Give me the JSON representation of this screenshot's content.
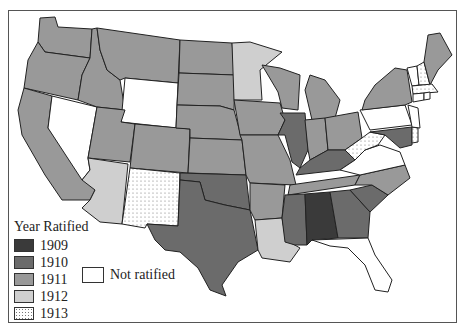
{
  "legend": {
    "title": "Year Ratified",
    "items": [
      {
        "label": "1909",
        "color": "#3a3a3a",
        "pattern": "solid"
      },
      {
        "label": "1910",
        "color": "#6b6b6b",
        "pattern": "solid"
      },
      {
        "label": "1911",
        "color": "#999999",
        "pattern": "solid"
      },
      {
        "label": "1912",
        "color": "#cfcfcf",
        "pattern": "solid"
      },
      {
        "label": "1913",
        "color": "#ffffff",
        "pattern": "dotted"
      }
    ],
    "not_ratified": {
      "label": "Not ratified",
      "color": "#ffffff"
    }
  },
  "states": {
    "1909": [
      "Alabama"
    ],
    "1910": [
      "Kentucky",
      "South Carolina",
      "Illinois",
      "Mississippi",
      "Oklahoma",
      "Maryland",
      "Georgia",
      "Texas"
    ],
    "1911": [
      "Washington",
      "Oregon",
      "California",
      "Idaho",
      "Montana",
      "Utah",
      "Colorado",
      "North Dakota",
      "South Dakota",
      "Nebraska",
      "Kansas",
      "Iowa",
      "Missouri",
      "Arkansas",
      "Wisconsin",
      "Michigan",
      "Indiana",
      "Ohio",
      "Tennessee",
      "North Carolina",
      "New York",
      "Maine"
    ],
    "1912": [
      "Arizona",
      "Minnesota",
      "Louisiana"
    ],
    "1913": [
      "New Mexico",
      "West Virginia",
      "New Hampshire",
      "Massachusetts",
      "Delaware"
    ],
    "not_ratified": [
      "Nevada",
      "Wyoming",
      "Florida",
      "Virginia",
      "Pennsylvania",
      "Vermont",
      "Connecticut",
      "Rhode Island",
      "New Jersey"
    ]
  }
}
